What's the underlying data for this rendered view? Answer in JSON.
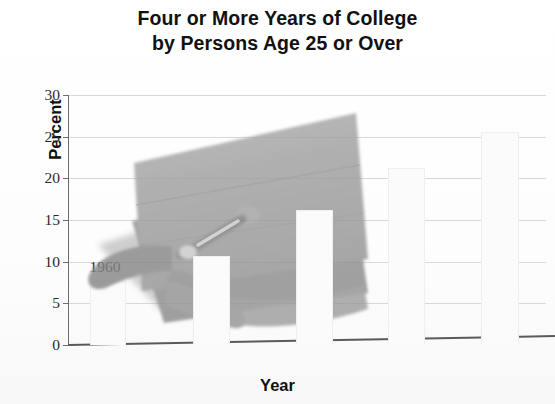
{
  "title": {
    "line1": "Four or More Years of College",
    "line2": "by Persons Age 25 or Over"
  },
  "axes": {
    "x_title": "Year",
    "y_title": "Percent",
    "y_ticks": [
      "0",
      "5",
      "10",
      "15",
      "20",
      "25",
      "30"
    ],
    "x_ticks": [
      "1960",
      "1970",
      "1980",
      "1990",
      "2000"
    ]
  },
  "overlay": {
    "image_name": "graduation-cap-photo",
    "cap_color": "#9b9b9b",
    "cap_shadow_color": "#8a8a8a",
    "tassel_color": "#7e7e7e"
  },
  "colors": {
    "bar_fill": "#fbfbfb",
    "bar_border": "#efefef",
    "axis": "#5a5a5a",
    "grid": "#d8d8d8",
    "text": "#1a1a1a"
  },
  "chart_data": {
    "type": "bar",
    "title": "Four or More Years of College by Persons Age 25 or Over",
    "xlabel": "Year",
    "ylabel": "Percent",
    "categories": [
      "1960",
      "1970",
      "1980",
      "1990",
      "2000"
    ],
    "values": [
      7.7,
      10.7,
      16.2,
      21.3,
      25.6
    ],
    "ylim": [
      0,
      30
    ],
    "yticks": [
      0,
      5,
      10,
      15,
      20,
      25,
      30
    ],
    "xlim": [
      1955,
      2005
    ],
    "grid": true,
    "legend": false,
    "annotation": "Photograph of a graduation mortarboard cap overlaid on the plot area"
  }
}
